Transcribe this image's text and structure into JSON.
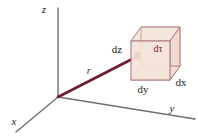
{
  "figure": {
    "type": "3d-coordinate-diagram",
    "background_color": "#ffffff"
  },
  "axes": {
    "x": {
      "label": "x",
      "italic": true,
      "color": "#58595b"
    },
    "y": {
      "label": "y",
      "italic": true,
      "color": "#58595b"
    },
    "z": {
      "label": "z",
      "italic": true,
      "color": "#58595b"
    }
  },
  "vector": {
    "label": "r",
    "italic": true,
    "color": "#6b1f2e",
    "has_arrowhead": true
  },
  "volume_element": {
    "label": "dτ",
    "label_color": "#7a2230",
    "fill_color": "#f2e0d6",
    "edge_color": "#b07a7e",
    "edge_labels": {
      "dx": "dx",
      "dy": "dy",
      "dz": "dz"
    }
  }
}
